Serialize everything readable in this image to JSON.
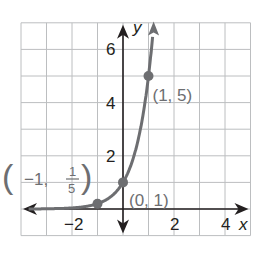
{
  "chart_data": {
    "type": "line",
    "title": "",
    "xlabel": "x",
    "ylabel": "y",
    "xlim": [
      -4,
      5
    ],
    "ylim": [
      -1,
      7
    ],
    "grid": true,
    "x_ticks": [
      {
        "value": -2,
        "label": "−2"
      },
      {
        "value": 2,
        "label": "2"
      },
      {
        "value": 4,
        "label": "4"
      }
    ],
    "y_ticks": [
      {
        "value": 2,
        "label": "2"
      },
      {
        "value": 4,
        "label": "4"
      },
      {
        "value": 6,
        "label": "6"
      }
    ],
    "function": "y = 5^x",
    "series": [
      {
        "name": "y = 5^x",
        "x": [
          -4,
          -3,
          -2,
          -1,
          -0.5,
          0,
          0.5,
          1,
          1.2
        ],
        "y": [
          0.0016,
          0.008,
          0.04,
          0.2,
          0.447,
          1,
          2.236,
          5,
          6.9
        ]
      }
    ],
    "points": [
      {
        "x": -1,
        "y": 0.2,
        "label_main": "−1,",
        "label_num": "1",
        "label_den": "5"
      },
      {
        "x": 0,
        "y": 1,
        "label": "(0, 1)"
      },
      {
        "x": 1,
        "y": 5,
        "label": "(1, 5)"
      }
    ],
    "colors": {
      "curve": "#6d6e71",
      "axis": "#231f20",
      "grid": "#bcbec0"
    }
  }
}
